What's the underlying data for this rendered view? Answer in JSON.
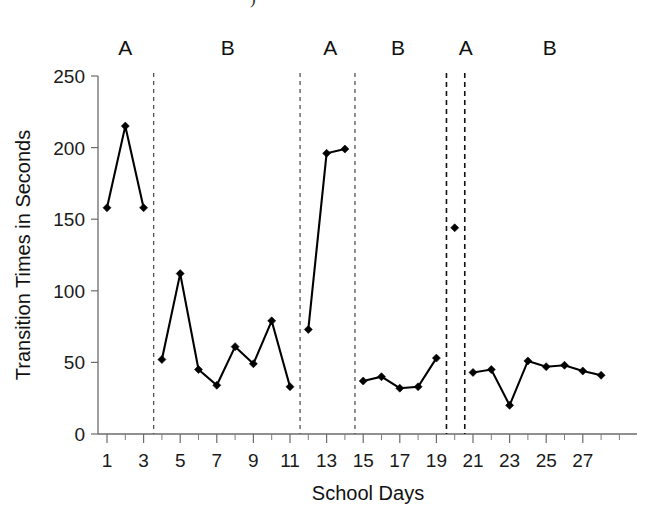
{
  "chart_data": {
    "type": "line",
    "title": "",
    "xlabel": "School Days",
    "ylabel": "Transition Times in Seconds",
    "xlim": [
      0,
      29
    ],
    "ylim": [
      0,
      250
    ],
    "ytick_values": [
      0,
      50,
      100,
      150,
      200,
      250
    ],
    "ytick_labels": [
      "0",
      "50",
      "100",
      "150",
      "200",
      "250"
    ],
    "xtick_values": [
      1,
      3,
      5,
      7,
      9,
      11,
      13,
      15,
      17,
      19,
      21,
      23,
      25,
      27
    ],
    "xtick_labels": [
      "1",
      "3",
      "5",
      "7",
      "9",
      "11",
      "13",
      "15",
      "17",
      "19",
      "21",
      "23",
      "25",
      "27"
    ],
    "x_minor_ticks": [
      2,
      4,
      6,
      8,
      10,
      12,
      14,
      16,
      18,
      20,
      22,
      24,
      26,
      28
    ],
    "grid": false,
    "legend": "none",
    "marker": "diamond",
    "phases": [
      {
        "label": "A",
        "label_x": 2.0,
        "days": [
          1,
          2,
          3
        ],
        "values": [
          158,
          215,
          158
        ]
      },
      {
        "label": "B",
        "label_x": 7.6,
        "days": [
          4,
          5,
          6,
          7,
          8,
          9,
          10,
          11
        ],
        "values": [
          52,
          112,
          45,
          34,
          61,
          49,
          79,
          33
        ]
      },
      {
        "label": "A",
        "label_x": 13.2,
        "days": [
          12,
          13,
          14
        ],
        "values": [
          73,
          196,
          199
        ]
      },
      {
        "label": "B",
        "label_x": 16.9,
        "days": [
          15,
          16,
          17,
          18,
          19
        ],
        "values": [
          37,
          40,
          32,
          33,
          53
        ]
      },
      {
        "label": "A",
        "label_x": 20.6,
        "days": [
          20
        ],
        "values": [
          144
        ]
      },
      {
        "label": "B",
        "label_x": 25.2,
        "days": [
          21,
          22,
          23,
          24,
          25,
          26,
          27,
          28
        ],
        "values": [
          43,
          45,
          20,
          51,
          47,
          48,
          44,
          41
        ]
      }
    ],
    "phase_dividers": [
      3.55,
      11.55,
      14.55,
      19.55,
      20.55
    ],
    "series": [
      {
        "name": "Transition Times",
        "x": [
          1,
          2,
          3,
          4,
          5,
          6,
          7,
          8,
          9,
          10,
          11,
          12,
          13,
          14,
          15,
          16,
          17,
          18,
          19,
          20,
          21,
          22,
          23,
          24,
          25,
          26,
          27,
          28
        ],
        "values": [
          158,
          215,
          158,
          52,
          112,
          45,
          34,
          61,
          49,
          79,
          33,
          73,
          196,
          199,
          37,
          40,
          32,
          33,
          53,
          144,
          43,
          45,
          20,
          51,
          47,
          48,
          44,
          41
        ]
      }
    ],
    "colors": {
      "line": "#000000",
      "marker": "#000000",
      "axis": "#6b6b6b",
      "divider": "#111111",
      "background": "#ffffff"
    }
  },
  "caption_fragment": ")"
}
